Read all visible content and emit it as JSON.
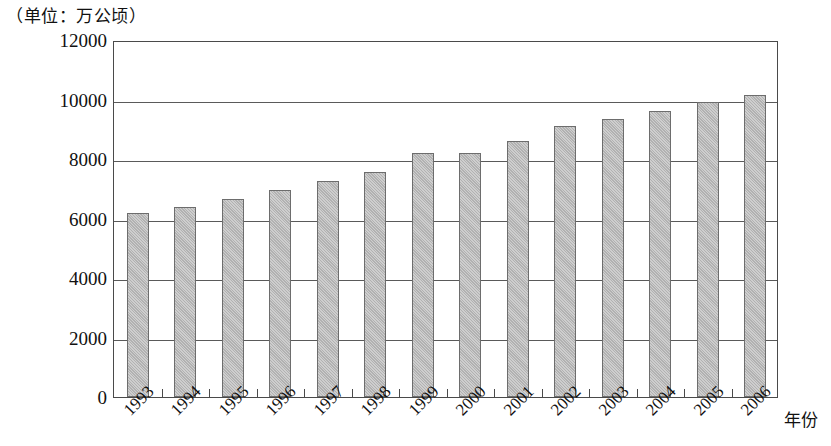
{
  "caption": {
    "unit_label": "（单位：万公顷）"
  },
  "axes": {
    "x_title": "年份",
    "y_ticks": [
      "0",
      "2000",
      "4000",
      "6000",
      "8000",
      "10000",
      "12000"
    ]
  },
  "colors": {
    "bar_fill": "#b9b9b9",
    "bar_border": "#6d6d6d",
    "frame": "#4a4a4a",
    "gridline": "#5a5a5a",
    "text": "#111111",
    "background": "#ffffff"
  },
  "chart_data": {
    "type": "bar",
    "title": "",
    "subtitle": "",
    "xlabel": "年份",
    "ylabel": "（单位：万公顷）",
    "categories": [
      "1993",
      "1994",
      "1995",
      "1996",
      "1997",
      "1998",
      "1999",
      "2000",
      "2001",
      "2002",
      "2003",
      "2004",
      "2005",
      "2006"
    ],
    "values": [
      6200,
      6400,
      6650,
      6950,
      7250,
      7550,
      8200,
      8200,
      8600,
      9100,
      9350,
      9600,
      9900,
      10150
    ],
    "ylim": [
      0,
      12000
    ],
    "y_tick_values": [
      0,
      2000,
      4000,
      6000,
      8000,
      10000,
      12000
    ],
    "grid": true,
    "grid_axis": "y",
    "legend": false,
    "legend_position": "none",
    "data_labels": false,
    "series": [
      {
        "name": "面积",
        "values": [
          6200,
          6400,
          6650,
          6950,
          7250,
          7550,
          8200,
          8200,
          8600,
          9100,
          9350,
          9600,
          9900,
          10150
        ]
      }
    ]
  }
}
